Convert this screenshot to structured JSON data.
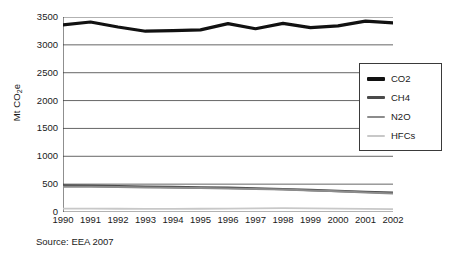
{
  "chart_data": {
    "type": "line",
    "title": "",
    "subtitle": "",
    "xlabel": "",
    "ylabel": "Mt CO2e",
    "ylabel_html": "Mt CO<sub>2</sub>e",
    "categories": [
      "1990",
      "1991",
      "1992",
      "1993",
      "1994",
      "1995",
      "1996",
      "1997",
      "1998",
      "1999",
      "2000",
      "2001",
      "2002"
    ],
    "x": [
      1990,
      1991,
      1992,
      1993,
      1994,
      1995,
      1996,
      1997,
      1998,
      1999,
      2000,
      2001,
      2002
    ],
    "xlim": [
      1990,
      2002
    ],
    "ylim": [
      0,
      3500
    ],
    "yticks": [
      0,
      500,
      1000,
      1500,
      2000,
      2500,
      3000,
      3500
    ],
    "ytick_labels": [
      "0",
      "500",
      "1000",
      "1500",
      "2000",
      "2500",
      "3000",
      "3500"
    ],
    "grid": true,
    "grid_axis": "y",
    "legend_position": "right",
    "series": [
      {
        "name": "CO2",
        "color": "#111111",
        "width": 3.2,
        "values": [
          3360,
          3410,
          3320,
          3245,
          3255,
          3270,
          3380,
          3290,
          3385,
          3310,
          3340,
          3425,
          3395
        ]
      },
      {
        "name": "CH4",
        "color": "#4a4a4a",
        "width": 2.4,
        "values": [
          478,
          472,
          463,
          455,
          448,
          441,
          434,
          424,
          410,
          395,
          378,
          362,
          348
        ]
      },
      {
        "name": "N2O",
        "color": "#8c8c8c",
        "width": 2.0,
        "values": [
          455,
          452,
          447,
          441,
          436,
          430,
          424,
          415,
          402,
          388,
          372,
          352,
          332
        ]
      },
      {
        "name": "HFCs",
        "color": "#c8c8c8",
        "width": 1.8,
        "values": [
          62,
          60,
          58,
          55,
          56,
          58,
          62,
          66,
          70,
          66,
          60,
          55,
          50
        ]
      }
    ]
  },
  "legend": {
    "items": [
      {
        "label": "CO2",
        "color": "#111111",
        "thickness": 4
      },
      {
        "label": "CH4",
        "color": "#4a4a4a",
        "thickness": 3
      },
      {
        "label": "N2O",
        "color": "#8c8c8c",
        "thickness": 2
      },
      {
        "label": "HFCs",
        "color": "#c8c8c8",
        "thickness": 2
      }
    ]
  },
  "source": {
    "text": "Source: EEA 2007"
  }
}
